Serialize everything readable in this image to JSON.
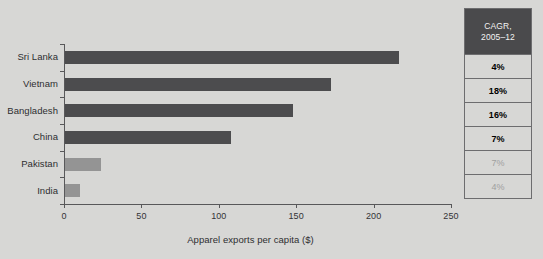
{
  "chart_data": {
    "type": "bar",
    "orientation": "horizontal",
    "title": "",
    "xlabel": "Apparel exports per capita ($)",
    "ylabel": "",
    "xlim": [
      0,
      250
    ],
    "xticks": [
      0,
      50,
      100,
      150,
      200,
      250
    ],
    "xtick_labels": [
      "0",
      "50",
      "100",
      "150",
      "200",
      "250"
    ],
    "grid": false,
    "legend": null,
    "categories": [
      "Sri Lanka",
      "Vietnam",
      "Bangladesh",
      "China",
      "Pakistan",
      "India"
    ],
    "values": [
      216,
      172,
      147,
      107,
      23,
      10
    ],
    "bar_colors": [
      "#4c4c4e",
      "#4c4c4e",
      "#4c4c4e",
      "#4c4c4e",
      "#949494",
      "#949494"
    ],
    "annotations": []
  },
  "cagr_table": {
    "header_line1": "CAGR,",
    "header_line2": "2005–12",
    "rows": [
      {
        "label": "4%",
        "dim": false
      },
      {
        "label": "18%",
        "dim": false
      },
      {
        "label": "16%",
        "dim": false
      },
      {
        "label": "7%",
        "dim": false
      },
      {
        "label": "7%",
        "dim": true
      },
      {
        "label": "4%",
        "dim": true
      }
    ]
  },
  "colors": {
    "background": "#d7d7d5",
    "bar_dark": "#4c4c4e",
    "bar_light": "#949494",
    "axis": "#58585a",
    "header_fill": "#4a4a4c",
    "header_text": "#f2f2f2",
    "text": "#2e2e30",
    "dim_text": "#a0a09f",
    "table_border": "#6d6d6f"
  }
}
